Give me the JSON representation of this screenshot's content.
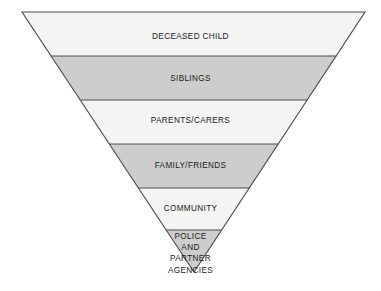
{
  "figure": {
    "type": "inverted-triangle-funnel",
    "title": "",
    "background_color": "#ffffff",
    "outline_color": "#4a4a4a",
    "text_color": "#1a1a1a",
    "shade_light": "#f4f4f4",
    "shade_dark": "#cdcdcd",
    "apex": {
      "x": 194,
      "y": 272
    },
    "top_left": {
      "x": 22,
      "y": 12
    },
    "top_right": {
      "x": 365,
      "y": 12
    },
    "bands": [
      {
        "id": "deceased-child",
        "label": "DECEASED CHILD",
        "lines": [
          "DECEASED CHILD"
        ],
        "fill": "#f4f4f4",
        "shade": "light",
        "y_top": 12,
        "y_bottom": 56,
        "label_y": 33,
        "order": 1
      },
      {
        "id": "siblings",
        "label": "SIBLINGS",
        "lines": [
          "SIBLINGS"
        ],
        "fill": "#cdcdcd",
        "shade": "dark",
        "y_top": 56,
        "y_bottom": 100,
        "label_y": 75,
        "order": 2
      },
      {
        "id": "parents-carers",
        "label": "PARENTS/CARERS",
        "lines": [
          "PARENTS/CARERS"
        ],
        "fill": "#f4f4f4",
        "shade": "light",
        "y_top": 100,
        "y_bottom": 144,
        "label_y": 117,
        "order": 3
      },
      {
        "id": "family-friends",
        "label": "FAMILY/FRIENDS",
        "lines": [
          "FAMILY/FRIENDS"
        ],
        "fill": "#cdcdcd",
        "shade": "dark",
        "y_top": 144,
        "y_bottom": 188,
        "label_y": 162,
        "order": 4
      },
      {
        "id": "community",
        "label": "COMMUNITY",
        "lines": [
          "COMMUNITY"
        ],
        "fill": "#f4f4f4",
        "shade": "light",
        "y_top": 188,
        "y_bottom": 230,
        "label_y": 205,
        "order": 5
      },
      {
        "id": "police-and-partner-agencies",
        "label": "POLICE AND PARTNER AGENCIES",
        "lines": [
          "POLICE",
          "AND",
          "PARTNER",
          "AGENCIES"
        ],
        "fill": "#cdcdcd",
        "shade": "dark",
        "y_top": 230,
        "y_bottom": 272,
        "label_y": 231,
        "order": 6
      }
    ]
  }
}
